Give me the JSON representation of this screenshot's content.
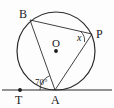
{
  "figure": {
    "background_color": "#fdfdfd",
    "stroke_color": "#2b2b2b",
    "label_color": "#1a1a1a"
  },
  "points": {
    "B": {
      "label": "B",
      "x": 30,
      "y": 20,
      "on_circle": true
    },
    "P": {
      "label": "P",
      "x": 92,
      "y": 34,
      "on_circle": true
    },
    "A": {
      "label": "A",
      "x": 55,
      "y": 90,
      "on_circle": true,
      "tangent_point": true
    },
    "T": {
      "label": "T",
      "x": 20,
      "y": 90,
      "on_tangent": true,
      "marker": "filled-dot"
    },
    "O": {
      "label": "O",
      "x": 56,
      "y": 51,
      "is_center": true,
      "marker": "filled-dot"
    }
  },
  "circle": {
    "center_x": 56,
    "center_y": 51,
    "radius": 39
  },
  "tangent_line": {
    "y": 90,
    "x_start": 2,
    "x_end": 112
  },
  "segments": [
    {
      "name": "chord-BA",
      "from": "B",
      "to": "A"
    },
    {
      "name": "chord-BP",
      "from": "B",
      "to": "P"
    },
    {
      "name": "chord-AP",
      "from": "A",
      "to": "P"
    }
  ],
  "angles": {
    "tangent_chord": {
      "label": "70°",
      "value": 70,
      "at_point": "A",
      "between": "tangent TA and chord AB"
    },
    "inscribed": {
      "label": "x",
      "value": null,
      "at_point": "P",
      "between": "chord PB and chord PA"
    }
  }
}
